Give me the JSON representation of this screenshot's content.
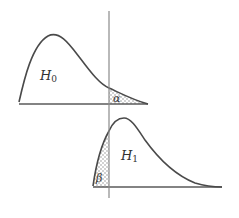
{
  "diagram": {
    "type": "hypothesis-test-error-regions",
    "colors": {
      "background": "#ffffff",
      "curve": "#4a4a4a",
      "axis": "#6a6a6a",
      "critical_line": "#8a8a8a",
      "shading": "#9a9a9a"
    },
    "upper_distribution": {
      "label_main": "H",
      "label_sub": "0",
      "shaded_region_label": "α",
      "description": "Null hypothesis distribution; right tail beyond critical value shaded (α)"
    },
    "lower_distribution": {
      "label_main": "H",
      "label_sub": "1",
      "shaded_region_label": "β",
      "description": "Alternative hypothesis distribution; left tail before critical value shaded (β)"
    },
    "critical_line": {
      "description": "Vertical line at critical value crossing both distributions"
    }
  }
}
